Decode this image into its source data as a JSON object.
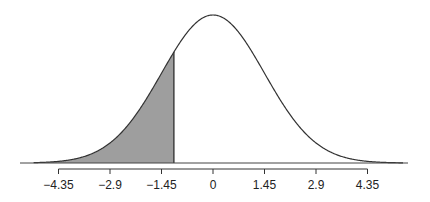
{
  "chart_data": {
    "type": "area",
    "title": "",
    "xlabel": "",
    "ylabel": "",
    "distribution": "normal",
    "mean": 0,
    "sd": 1.45,
    "shaded_region": {
      "from": "-inf",
      "to": -1.1,
      "color": "#9e9e9e"
    },
    "tick_values": [
      -4.35,
      -2.9,
      -1.45,
      0,
      1.45,
      2.9,
      4.35
    ],
    "tick_labels": [
      "−4.35",
      "−2.9",
      "−1.45",
      "0",
      "1.45",
      "2.9",
      "4.35"
    ],
    "xlim": [
      -5.05,
      5.35
    ],
    "grid": false,
    "legend": null
  }
}
